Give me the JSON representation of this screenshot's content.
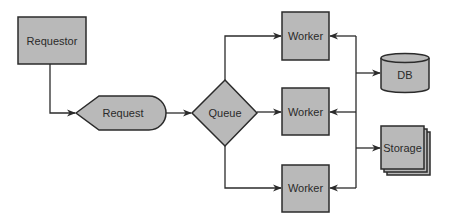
{
  "diagram": {
    "type": "flowchart",
    "colors": {
      "node_fill": "#b9b9b9",
      "stroke": "#2b2b2b",
      "background": "#ffffff"
    },
    "nodes": [
      {
        "id": "requestor",
        "label": "Requestor",
        "shape": "rectangle"
      },
      {
        "id": "request",
        "label": "Request",
        "shape": "display"
      },
      {
        "id": "queue",
        "label": "Queue",
        "shape": "diamond"
      },
      {
        "id": "worker1",
        "label": "Worker",
        "shape": "rectangle"
      },
      {
        "id": "worker2",
        "label": "Worker",
        "shape": "rectangle"
      },
      {
        "id": "worker3",
        "label": "Worker",
        "shape": "rectangle"
      },
      {
        "id": "db",
        "label": "DB",
        "shape": "cylinder"
      },
      {
        "id": "storage",
        "label": "Storage",
        "shape": "stacked-rectangles"
      }
    ],
    "edges": [
      {
        "from": "requestor",
        "to": "request"
      },
      {
        "from": "request",
        "to": "queue"
      },
      {
        "from": "queue",
        "to": "worker1"
      },
      {
        "from": "queue",
        "to": "worker2"
      },
      {
        "from": "queue",
        "to": "worker3"
      },
      {
        "from": "bus",
        "to": "worker1"
      },
      {
        "from": "bus",
        "to": "worker2"
      },
      {
        "from": "bus",
        "to": "worker3"
      },
      {
        "from": "bus",
        "to": "db"
      },
      {
        "from": "bus",
        "to": "storage"
      }
    ]
  }
}
